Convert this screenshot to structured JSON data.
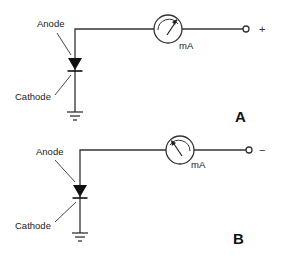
{
  "diagram": {
    "type": "circuit-schematic",
    "panels": [
      {
        "id": "A",
        "label": "A",
        "anode_label": "Anode",
        "cathode_label": "Cathode",
        "meter_label": "mA",
        "terminal_polarity": "+",
        "needle_direction": "up-right"
      },
      {
        "id": "B",
        "label": "B",
        "anode_label": "Anode",
        "cathode_label": "Cathode",
        "meter_label": "mA",
        "terminal_polarity": "−",
        "needle_direction": "up-left"
      }
    ],
    "colors": {
      "line": "#333333",
      "background": "#ffffff"
    }
  }
}
